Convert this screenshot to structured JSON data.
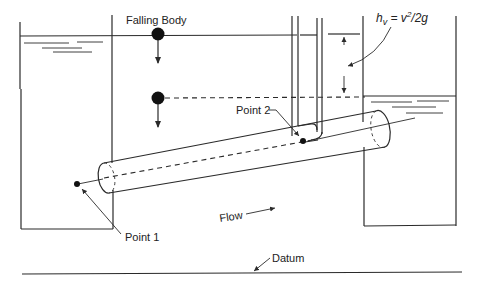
{
  "figure": {
    "labels": {
      "falling_body": "Falling Body",
      "velocity_head_h": "h",
      "velocity_head_sub": "v",
      "velocity_head_eq": " = v",
      "velocity_head_sup": "2",
      "velocity_head_tail": "/2g",
      "point_1": "Point 1",
      "point_2": "Point 2",
      "flow": "Flow",
      "datum": "Datum"
    },
    "colors": {
      "line": "#2a2a2a",
      "background": "#ffffff",
      "dot": "#111111"
    },
    "components": [
      "left-reservoir",
      "right-reservoir",
      "inclined-pipe",
      "pitot-tube",
      "falling-body-top",
      "falling-body-bottom",
      "energy-grade-dashed-line",
      "datum-line"
    ]
  }
}
